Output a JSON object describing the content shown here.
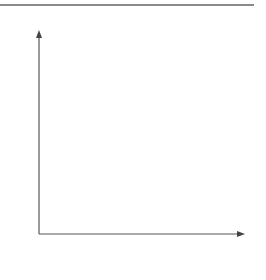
{
  "diagram": {
    "type": "coordinate-grid",
    "x_axis": {
      "label": "x",
      "ticks": [
        "1",
        "2",
        "3",
        "4",
        "5",
        "6",
        "7",
        "8"
      ],
      "origin_label": "0"
    },
    "y_axis": {
      "label": "y",
      "ticks": [
        "1",
        "2",
        "3",
        "4",
        "5",
        "6",
        "7",
        "8"
      ]
    },
    "points": [
      {
        "name": "A",
        "x": 3,
        "y": 5
      },
      {
        "name": "B",
        "x": 7,
        "y": 3
      }
    ],
    "segments": [
      {
        "from": "A",
        "to": "B"
      }
    ],
    "colors": {
      "grid": "#dcdcdc",
      "axis": "#555555",
      "segment": "#555555",
      "frame_rule": "#8a8a8a"
    }
  }
}
